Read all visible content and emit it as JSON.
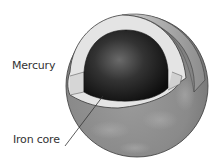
{
  "diagram": {
    "labels": {
      "planet": "Mercury",
      "core": "Iron core"
    },
    "colors": {
      "surface_dark": "#6e6e6e",
      "surface_light": "#a8a8a8",
      "mantle": "#e4e4e4",
      "core_dark": "#141414",
      "core_highlight": "#6a6a6a",
      "outline": "#3a3a3a",
      "text": "#333333"
    }
  }
}
